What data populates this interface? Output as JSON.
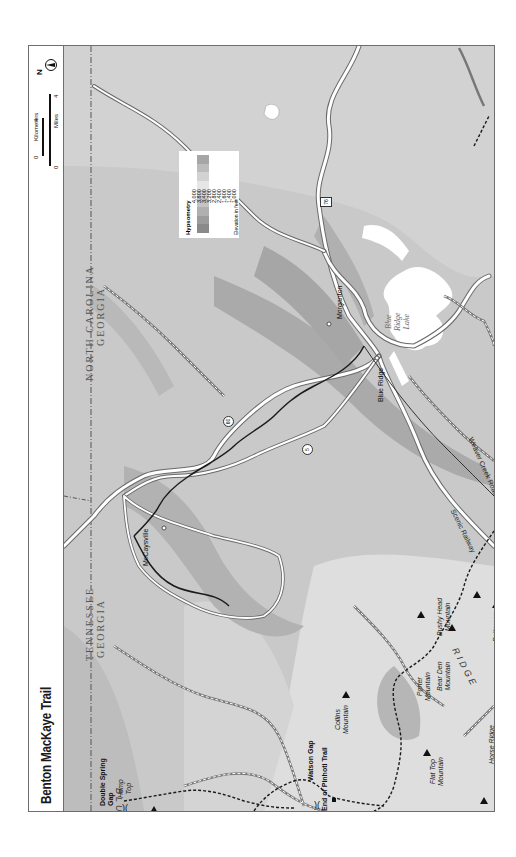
{
  "title": "Benton MacKaye Trail",
  "scale_bar": {
    "kilometers_label": "Kilometers",
    "km_start": "0",
    "km_end": "4",
    "miles_label": "Miles",
    "mi_start": "0",
    "mi_end": "4"
  },
  "north_arrow": {
    "label": "N",
    "icon": "north-arrow-icon"
  },
  "legend": {
    "title": "Hypsometry",
    "values": [
      "4,000",
      "3,800",
      "3,400",
      "3,200",
      "2,800",
      "2,400",
      "1,600",
      "1,400",
      "1,000"
    ],
    "colors": [
      "#8a8a8a",
      "#9c9c9c",
      "#b0b0b0",
      "#c4c4c4",
      "#d6d6d6",
      "#e6e6e6",
      "#d2d2d2",
      "#bcbcbc",
      "#a6a6a6"
    ],
    "unit_label": "Elevation in feet"
  },
  "states": {
    "tn_nc_border_north": "NORTH CAROLINA",
    "tn_nc_border_south": "GEORGIA",
    "tn_ga_north": "TENNESSEE",
    "tn_ga_south": "GEORGIA"
  },
  "towns": [
    {
      "name": "Morganton"
    },
    {
      "name": "Blue Ridge"
    },
    {
      "name": "McCaysville"
    }
  ],
  "water": {
    "lake": [
      "Blue",
      "Ridge",
      "Lake"
    ]
  },
  "roads": {
    "weaver_creek": "Weaver Creek Road",
    "scenic_railway": "Scenic Railway",
    "shields": [
      "76",
      "60",
      "5",
      "60",
      "64"
    ]
  },
  "features": {
    "double_spring_gap": [
      "Double Spring",
      "Gap"
    ],
    "hemp_top": [
      "Hemp",
      "Top"
    ],
    "watson_gap": "Watson Gap",
    "end_pinhoti": "End of Pinhoti Trail",
    "collins_mountain": [
      "Collins",
      "Mountain"
    ],
    "porter_mountain": [
      "Porter",
      "Mountain"
    ],
    "bear_den_mountain": [
      "Bear Den",
      "Mountain"
    ],
    "bushy_head_mountain": [
      "Bushy Head",
      "Mountain"
    ],
    "patterson_mountain": [
      "Patterson",
      "Mountain"
    ],
    "flat_top_mountain": [
      "Flat Top",
      "Mountain"
    ],
    "horse_ridge": "Horse Ridge",
    "pink_knob": [
      "Pink",
      "Knob"
    ],
    "blue_ridge_label_left": "BLUE RIDGE",
    "blue_ridge_label_bottom": "BLUE RIDGE",
    "ridge_label_center": "RIDGE"
  },
  "colors": {
    "frame": "#6e6e6e",
    "background_mid": "#c9c9c9",
    "background_low": "#dcdcdc",
    "background_high": "#a8a8a8",
    "trail": "#1a1a1a",
    "road_fill": "#ffffff",
    "road_casing": "#6a6a6a",
    "lake": "#ffffff"
  }
}
